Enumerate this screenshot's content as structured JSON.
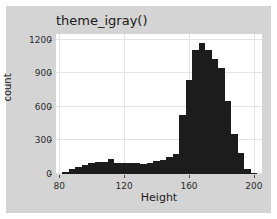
{
  "figure": {
    "title": "theme_igray()",
    "background_color": "#d4d4d4",
    "panel_color": "#ffffff",
    "grid_color": "#e3e3e3",
    "bar_color": "#1c1c1c"
  },
  "chart_data": {
    "type": "bar",
    "title": "theme_igray()",
    "xlabel": "Height",
    "ylabel": "count",
    "xlim": [
      78,
      205
    ],
    "ylim": [
      0,
      1250
    ],
    "xticks": [
      80,
      120,
      160,
      200
    ],
    "xtick_labels": [
      "80",
      "120",
      "160",
      "200"
    ],
    "yticks": [
      0,
      300,
      600,
      900,
      1200
    ],
    "ytick_labels": [
      "0",
      "300",
      "600",
      "900",
      "1200"
    ],
    "grid": true,
    "legend": "none",
    "bin_width": 4,
    "bin_starts": [
      82,
      86,
      90,
      94,
      98,
      102,
      106,
      110,
      114,
      118,
      122,
      126,
      130,
      134,
      138,
      142,
      146,
      150,
      154,
      158,
      162,
      166,
      170,
      174,
      178,
      182,
      186,
      190,
      194,
      198
    ],
    "categories": [
      "82",
      "86",
      "90",
      "94",
      "98",
      "102",
      "106",
      "110",
      "114",
      "118",
      "122",
      "126",
      "130",
      "134",
      "138",
      "142",
      "146",
      "150",
      "154",
      "158",
      "162",
      "166",
      "170",
      "174",
      "178",
      "182",
      "186",
      "190",
      "194",
      "198"
    ],
    "values": [
      20,
      45,
      60,
      80,
      95,
      105,
      110,
      130,
      95,
      100,
      100,
      95,
      90,
      100,
      115,
      125,
      155,
      175,
      530,
      835,
      1105,
      1170,
      1105,
      1030,
      950,
      650,
      360,
      185,
      45,
      10
    ]
  }
}
